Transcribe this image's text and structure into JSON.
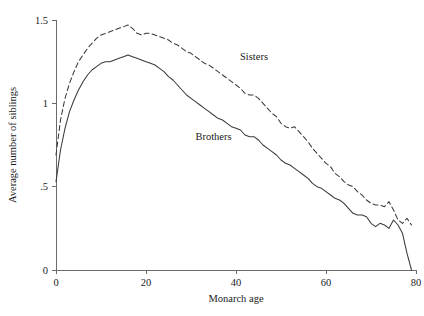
{
  "chart_data": {
    "type": "line",
    "title": "",
    "subtitle": "",
    "xlabel": "Monarch age",
    "ylabel": "Average number of siblings",
    "xlim": [
      0,
      80
    ],
    "ylim": [
      0,
      1.5
    ],
    "xticks": [
      0,
      20,
      40,
      60,
      80
    ],
    "xticklabels": [
      "0",
      "20",
      "40",
      "60",
      "80"
    ],
    "yticks": [
      0,
      0.5,
      1,
      1.5
    ],
    "yticklabels": [
      "0",
      ".5",
      "1",
      "1.5"
    ],
    "grid": false,
    "legend_position": "inline-annotation",
    "annotations": [
      {
        "text": "Sisters",
        "x": 44,
        "y": 1.26
      },
      {
        "text": "Brothers",
        "x": 35,
        "y": 0.78
      }
    ],
    "series": [
      {
        "name": "Sisters",
        "style": "dashed",
        "color": "#3a3a3a",
        "x": [
          0,
          1,
          2,
          3,
          4,
          5,
          6,
          7,
          8,
          9,
          10,
          11,
          12,
          13,
          14,
          15,
          16,
          17,
          18,
          19,
          20,
          21,
          22,
          23,
          24,
          25,
          26,
          27,
          28,
          29,
          30,
          31,
          32,
          33,
          34,
          35,
          36,
          37,
          38,
          39,
          40,
          41,
          42,
          43,
          44,
          45,
          46,
          47,
          48,
          49,
          50,
          51,
          52,
          53,
          54,
          55,
          56,
          57,
          58,
          59,
          60,
          61,
          62,
          63,
          64,
          65,
          66,
          67,
          68,
          69,
          70,
          71,
          72,
          73,
          74,
          75,
          76,
          77,
          78,
          79
        ],
        "values": [
          0.69,
          0.9,
          1.03,
          1.12,
          1.19,
          1.25,
          1.29,
          1.33,
          1.36,
          1.39,
          1.41,
          1.42,
          1.43,
          1.44,
          1.45,
          1.46,
          1.47,
          1.45,
          1.42,
          1.41,
          1.42,
          1.42,
          1.41,
          1.4,
          1.39,
          1.38,
          1.36,
          1.35,
          1.33,
          1.31,
          1.3,
          1.28,
          1.26,
          1.24,
          1.23,
          1.21,
          1.19,
          1.17,
          1.15,
          1.13,
          1.11,
          1.09,
          1.06,
          1.05,
          1.05,
          1.03,
          1.0,
          0.97,
          0.94,
          0.92,
          0.88,
          0.86,
          0.85,
          0.86,
          0.83,
          0.8,
          0.77,
          0.73,
          0.7,
          0.67,
          0.64,
          0.62,
          0.58,
          0.56,
          0.53,
          0.51,
          0.5,
          0.47,
          0.45,
          0.42,
          0.4,
          0.39,
          0.39,
          0.38,
          0.41,
          0.36,
          0.3,
          0.28,
          0.31,
          0.27
        ]
      },
      {
        "name": "Brothers",
        "style": "solid",
        "color": "#3a3a3a",
        "x": [
          0,
          1,
          2,
          3,
          4,
          5,
          6,
          7,
          8,
          9,
          10,
          11,
          12,
          13,
          14,
          15,
          16,
          17,
          18,
          19,
          20,
          21,
          22,
          23,
          24,
          25,
          26,
          27,
          28,
          29,
          30,
          31,
          32,
          33,
          34,
          35,
          36,
          37,
          38,
          39,
          40,
          41,
          42,
          43,
          44,
          45,
          46,
          47,
          48,
          49,
          50,
          51,
          52,
          53,
          54,
          55,
          56,
          57,
          58,
          59,
          60,
          61,
          62,
          63,
          64,
          65,
          66,
          67,
          68,
          69,
          70,
          71,
          72,
          73,
          74,
          75,
          76,
          77,
          78,
          79
        ],
        "values": [
          0.53,
          0.72,
          0.85,
          0.95,
          1.02,
          1.08,
          1.13,
          1.17,
          1.2,
          1.22,
          1.24,
          1.25,
          1.25,
          1.26,
          1.27,
          1.28,
          1.29,
          1.28,
          1.27,
          1.26,
          1.25,
          1.24,
          1.23,
          1.21,
          1.19,
          1.16,
          1.14,
          1.11,
          1.08,
          1.05,
          1.03,
          1.01,
          0.99,
          0.97,
          0.95,
          0.93,
          0.91,
          0.9,
          0.88,
          0.86,
          0.85,
          0.84,
          0.81,
          0.8,
          0.8,
          0.78,
          0.75,
          0.73,
          0.71,
          0.69,
          0.66,
          0.64,
          0.63,
          0.61,
          0.59,
          0.57,
          0.55,
          0.52,
          0.5,
          0.49,
          0.47,
          0.45,
          0.43,
          0.42,
          0.4,
          0.37,
          0.34,
          0.33,
          0.33,
          0.32,
          0.28,
          0.26,
          0.28,
          0.27,
          0.25,
          0.3,
          0.27,
          0.22,
          0.1,
          0.0
        ]
      }
    ]
  }
}
